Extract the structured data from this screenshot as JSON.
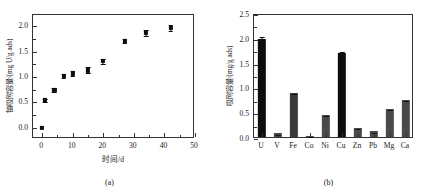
{
  "figure": {
    "panels": [
      {
        "caption": "(a)",
        "chart_data": {
          "type": "scatter",
          "title": "",
          "xlabel": "时间/d",
          "ylabel": "铀吸附容量/(mg U/g ads)",
          "xlim": [
            -3,
            50
          ],
          "ylim": [
            -0.22,
            2.22
          ],
          "xticks": [
            0,
            10,
            20,
            30,
            40,
            50
          ],
          "xtick_labels": [
            "0",
            "10",
            "20",
            "30",
            "40",
            "50"
          ],
          "yticks": [
            0.0,
            0.5,
            1.0,
            1.5,
            2.0
          ],
          "ytick_labels": [
            "0.0",
            "0.5",
            "1.0",
            "1.5",
            "2.0"
          ],
          "grid": false,
          "legend": "none",
          "x": [
            0,
            1,
            4,
            7,
            10,
            15,
            20,
            27,
            34,
            42
          ],
          "y": [
            0.0,
            0.54,
            0.75,
            1.02,
            1.07,
            1.13,
            1.31,
            1.7,
            1.87,
            1.97
          ],
          "yerr": [
            0.0,
            0.03,
            0.04,
            0.04,
            0.05,
            0.06,
            0.05,
            0.04,
            0.06,
            0.06
          ]
        }
      },
      {
        "caption": "(b)",
        "chart_data": {
          "type": "bar",
          "title": "",
          "xlabel": "",
          "ylabel": "吸附容量/(mg/g ads)",
          "ylim": [
            0,
            2.5
          ],
          "yticks": [
            0.0,
            0.5,
            1.0,
            1.5,
            2.0,
            2.5
          ],
          "ytick_labels": [
            "0.0",
            "0.5",
            "1.0",
            "1.5",
            "2.0",
            "2.5"
          ],
          "grid": false,
          "legend": "none",
          "categories": [
            "U",
            "V",
            "Fe",
            "Co",
            "Ni",
            "Cu",
            "Zn",
            "Pb",
            "Mg",
            "Ca"
          ],
          "values": [
            1.97,
            0.08,
            0.89,
            0.03,
            0.44,
            1.7,
            0.19,
            0.12,
            0.56,
            0.74
          ],
          "yerr": [
            0.09,
            0.01,
            0.02,
            0.005,
            0.02,
            0.05,
            0.01,
            0.01,
            0.02,
            0.03
          ],
          "bar_colors": [
            "#0d0d0d",
            "#4a4a4a",
            "#3a3a3a",
            "#4a4a4a",
            "#4a4a4a",
            "#0d0d0d",
            "#4a4a4a",
            "#4a4a4a",
            "#4a4a4a",
            "#4a4a4a"
          ]
        }
      }
    ]
  }
}
